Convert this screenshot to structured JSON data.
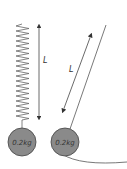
{
  "diagram": {
    "spring_system": {
      "length_label": "L",
      "mass_label": "0.2kg"
    },
    "pendulum_system": {
      "length_label": "L",
      "mass_label": "0.2kg"
    },
    "colors": {
      "mass_fill": "#8a8a8a",
      "line": "#555555",
      "text": "#333333"
    }
  }
}
